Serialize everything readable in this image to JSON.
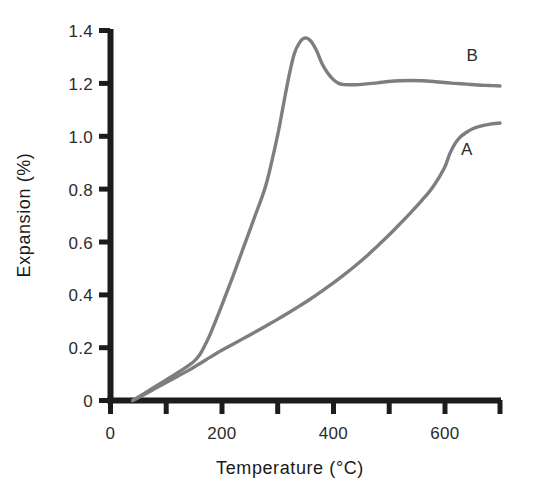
{
  "chart_data": {
    "type": "line",
    "title": "",
    "xlabel": "Temperature (°C)",
    "ylabel": "Expansion (%)",
    "xlim": [
      0,
      700
    ],
    "ylim": [
      0,
      1.4
    ],
    "grid": false,
    "legend_position": "inline-right",
    "x_ticks": [
      0,
      100,
      200,
      300,
      400,
      500,
      600,
      700
    ],
    "x_tick_labels": [
      "0",
      "",
      "200",
      "",
      "400",
      "",
      "600",
      ""
    ],
    "y_ticks": [
      0,
      0.2,
      0.4,
      0.6,
      0.8,
      1.0,
      1.2,
      1.4
    ],
    "y_tick_labels": [
      "0",
      "0.2",
      "0.4",
      "0.6",
      "0.8",
      "1.0",
      "1.2",
      "1.4"
    ],
    "curve_color": "#7e7e7e",
    "axis_color": "#1c1c1c",
    "background": "#ffffff",
    "series": [
      {
        "name": "A",
        "label": "A",
        "label_x": 640,
        "label_y": 0.93,
        "x": [
          40,
          60,
          80,
          100,
          120,
          140,
          160,
          180,
          200,
          220,
          240,
          260,
          280,
          300,
          320,
          340,
          360,
          380,
          400,
          420,
          440,
          460,
          480,
          500,
          520,
          540,
          560,
          580,
          600,
          610,
          620,
          630,
          640,
          650,
          660,
          680,
          700
        ],
        "y": [
          0.0,
          0.022,
          0.045,
          0.068,
          0.091,
          0.114,
          0.139,
          0.165,
          0.19,
          0.213,
          0.236,
          0.259,
          0.283,
          0.307,
          0.332,
          0.358,
          0.385,
          0.414,
          0.444,
          0.476,
          0.51,
          0.546,
          0.585,
          0.625,
          0.668,
          0.712,
          0.758,
          0.81,
          0.88,
          0.935,
          0.975,
          1.0,
          1.015,
          1.027,
          1.035,
          1.045,
          1.05
        ]
      },
      {
        "name": "B",
        "label": "B",
        "label_x": 650,
        "label_y": 1.285,
        "x": [
          40,
          60,
          80,
          100,
          120,
          140,
          150,
          160,
          170,
          180,
          200,
          220,
          240,
          260,
          280,
          300,
          310,
          320,
          330,
          340,
          350,
          360,
          370,
          380,
          390,
          400,
          410,
          420,
          440,
          460,
          480,
          500,
          520,
          540,
          560,
          580,
          600,
          620,
          640,
          660,
          680,
          700
        ],
        "y": [
          0.0,
          0.026,
          0.052,
          0.078,
          0.104,
          0.132,
          0.148,
          0.172,
          0.21,
          0.255,
          0.36,
          0.47,
          0.585,
          0.7,
          0.82,
          1.0,
          1.11,
          1.22,
          1.31,
          1.355,
          1.372,
          1.36,
          1.325,
          1.275,
          1.24,
          1.215,
          1.2,
          1.195,
          1.195,
          1.198,
          1.202,
          1.207,
          1.21,
          1.211,
          1.21,
          1.207,
          1.203,
          1.2,
          1.197,
          1.194,
          1.192,
          1.19
        ]
      }
    ]
  },
  "figure": {
    "xlabel": "Temperature (°C)",
    "ylabel": "Expansion (%)",
    "y_tick_labels": [
      "1.4",
      "1.2",
      "1.0",
      "0.8",
      "0.6",
      "0.4",
      "0.2",
      "0"
    ],
    "x_tick_labels": [
      "0",
      "200",
      "400",
      "600"
    ],
    "label_a": "A",
    "label_b": "B"
  }
}
